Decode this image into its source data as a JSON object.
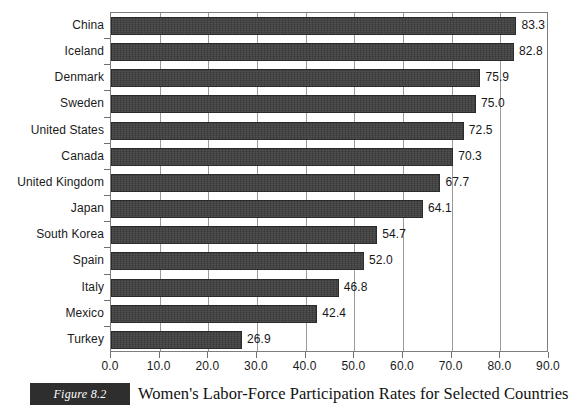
{
  "chart_data": {
    "type": "bar",
    "orientation": "horizontal",
    "title": "Women's Labor-Force Participation Rates for Selected Countries",
    "xlabel": "",
    "ylabel": "",
    "xlim": [
      0.0,
      90.0
    ],
    "xticks": [
      "0.0",
      "10.0",
      "20.0",
      "30.0",
      "40.0",
      "50.0",
      "60.0",
      "70.0",
      "80.0",
      "90.0"
    ],
    "xtick_values": [
      0,
      10,
      20,
      30,
      40,
      50,
      60,
      70,
      80,
      90
    ],
    "grid": "vertical",
    "legend": null,
    "categories": [
      "China",
      "Iceland",
      "Denmark",
      "Sweden",
      "United States",
      "Canada",
      "United Kingdom",
      "Japan",
      "South Korea",
      "Spain",
      "Italy",
      "Mexico",
      "Turkey"
    ],
    "values": [
      83.3,
      82.8,
      75.9,
      75.0,
      72.5,
      70.3,
      67.7,
      64.1,
      54.7,
      52.0,
      46.8,
      42.4,
      26.9
    ],
    "value_labels": [
      "83.3",
      "82.8",
      "75.9",
      "75.0",
      "72.5",
      "70.3",
      "67.7",
      "64.1",
      "54.7",
      "52.0",
      "46.8",
      "42.4",
      "26.9"
    ],
    "bar_color": "#3d3d3d",
    "bar_edge_color": "#2b2b2b",
    "gridline_color": "#9a9a9a",
    "axis_color": "#7d7d7d"
  },
  "figure": {
    "badge_label": "Figure 8.2",
    "caption": "Women's Labor-Force Participation Rates for Selected Countries"
  }
}
